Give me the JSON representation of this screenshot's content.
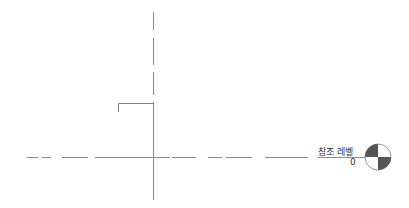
{
  "view": {
    "type": "elevation",
    "reference_level": {
      "name": "참조 레벨",
      "elevation": "0"
    },
    "colors": {
      "line": "#808080",
      "marker_fill": "#555555",
      "background": "#ffffff"
    }
  }
}
